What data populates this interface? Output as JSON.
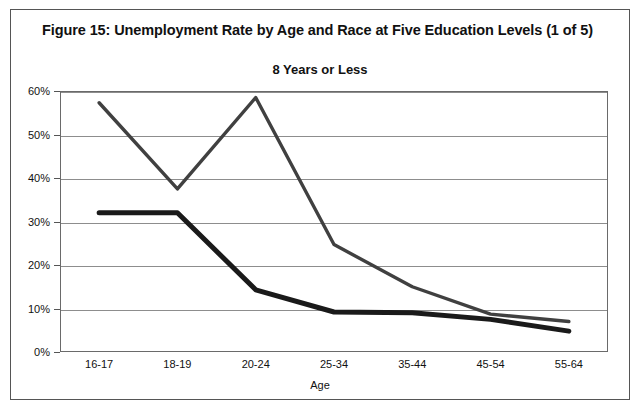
{
  "figure": {
    "title": "Figure 15: Unemployment Rate by Age and Race at Five Education Levels (1 of 5)"
  },
  "legend": {
    "position": "top-right",
    "entries": [
      {
        "label": "White",
        "color": "#1a1a1a"
      },
      {
        "label": "Black",
        "color": "#404040"
      }
    ]
  },
  "axes": {
    "x_label": "Age",
    "y_label": "",
    "y_ticks": [
      "0%",
      "10%",
      "20%",
      "30%",
      "40%",
      "50%",
      "60%"
    ]
  },
  "chart_data": {
    "type": "line",
    "title": "8 Years or Less",
    "xlabel": "Age",
    "ylabel": "",
    "categories": [
      "16-17",
      "18-19",
      "20-24",
      "25-34",
      "35-44",
      "45-54",
      "55-64"
    ],
    "series": [
      {
        "name": "White",
        "color": "#1a1a1a",
        "values": [
          32.0,
          32.0,
          14.3,
          9.2,
          9.0,
          7.5,
          4.8
        ]
      },
      {
        "name": "Black",
        "color": "#404040",
        "values": [
          57.3,
          37.5,
          58.5,
          24.7,
          15.0,
          8.7,
          7.0
        ]
      }
    ],
    "ylim": [
      0,
      60
    ],
    "ytick_values": [
      0,
      10,
      20,
      30,
      40,
      50,
      60
    ],
    "ytick_labels": [
      "0%",
      "10%",
      "20%",
      "30%",
      "40%",
      "50%",
      "60%"
    ],
    "grid": true,
    "legend_position": "top-right"
  }
}
